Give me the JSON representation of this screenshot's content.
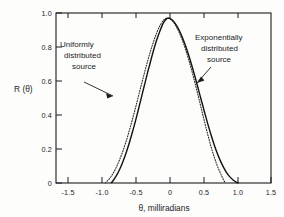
{
  "chart_data": {
    "type": "line",
    "title": "",
    "subtitle": "",
    "xlabel": "θ, milliradians",
    "ylabel": "R (θ)",
    "xlim": [
      -1.75,
      1.65
    ],
    "ylim": [
      0,
      1.0
    ],
    "grid": false,
    "legend_position": "inline-annotations",
    "xticks": [
      -1.5,
      -1.0,
      -0.5,
      0,
      0.5,
      1.0,
      1.5
    ],
    "xtick_labels": [
      "-1.5",
      "-1.0",
      "-0.5",
      "0",
      "0.5",
      "1.0",
      "1.5"
    ],
    "yticks": [
      0,
      0.2,
      0.4,
      0.6,
      0.8,
      1.0
    ],
    "ytick_labels": [
      "0",
      "0.2",
      "0.4",
      "0.6",
      "0.8",
      "1.0"
    ],
    "annotations": [
      {
        "name": "uniformly-distributed-source",
        "lines": [
          "Uniformly",
          "distributed",
          "source"
        ],
        "arrow_from": [
          -1.18,
          0.62
        ],
        "arrow_to": [
          -0.82,
          0.5
        ]
      },
      {
        "name": "exponentially-distributed-source",
        "lines": [
          "Exponentially",
          "distributed",
          "source"
        ],
        "arrow_from": [
          0.72,
          0.83
        ],
        "arrow_to": [
          0.45,
          0.61
        ]
      }
    ],
    "series": [
      {
        "name": "Uniformly distributed source",
        "style": "solid",
        "color": "#111111",
        "x": [
          -0.88,
          -0.85,
          -0.8,
          -0.75,
          -0.7,
          -0.65,
          -0.6,
          -0.55,
          -0.5,
          -0.45,
          -0.4,
          -0.35,
          -0.3,
          -0.25,
          -0.2,
          -0.15,
          -0.1,
          -0.05,
          0.0,
          0.03,
          0.05,
          0.1,
          0.15,
          0.2,
          0.25,
          0.3,
          0.35,
          0.4,
          0.45,
          0.5,
          0.55,
          0.6,
          0.65,
          0.7,
          0.75,
          0.8,
          0.85,
          0.9,
          0.95,
          1.0,
          1.05,
          1.1,
          1.14
        ],
        "y": [
          0.0,
          0.012,
          0.04,
          0.075,
          0.118,
          0.168,
          0.225,
          0.288,
          0.355,
          0.428,
          0.502,
          0.578,
          0.652,
          0.722,
          0.79,
          0.85,
          0.9,
          0.943,
          0.967,
          0.97,
          0.968,
          0.955,
          0.93,
          0.897,
          0.855,
          0.806,
          0.75,
          0.688,
          0.622,
          0.553,
          0.484,
          0.415,
          0.348,
          0.285,
          0.227,
          0.175,
          0.13,
          0.092,
          0.06,
          0.036,
          0.018,
          0.005,
          0.0
        ]
      },
      {
        "name": "Exponentially distributed source",
        "style": "dotted",
        "color": "#2b2b2b",
        "x": [
          -0.97,
          -0.95,
          -0.9,
          -0.85,
          -0.8,
          -0.75,
          -0.7,
          -0.65,
          -0.6,
          -0.55,
          -0.5,
          -0.45,
          -0.4,
          -0.35,
          -0.3,
          -0.25,
          -0.2,
          -0.15,
          -0.1,
          -0.05,
          0.0,
          0.04,
          0.08,
          0.12,
          0.16,
          0.2,
          0.25,
          0.3,
          0.35,
          0.4,
          0.45,
          0.5,
          0.55,
          0.6,
          0.65,
          0.7,
          0.75,
          0.8,
          0.85,
          0.9,
          0.93
        ],
        "y": [
          0.0,
          0.008,
          0.028,
          0.055,
          0.09,
          0.132,
          0.18,
          0.235,
          0.296,
          0.362,
          0.432,
          0.505,
          0.578,
          0.65,
          0.718,
          0.782,
          0.84,
          0.89,
          0.93,
          0.958,
          0.97,
          0.968,
          0.958,
          0.94,
          0.915,
          0.884,
          0.838,
          0.784,
          0.723,
          0.656,
          0.585,
          0.51,
          0.434,
          0.358,
          0.285,
          0.216,
          0.155,
          0.102,
          0.058,
          0.018,
          0.0
        ]
      }
    ]
  },
  "plot_geometry": {
    "left_px": 56,
    "right_px": 271,
    "top_px": 13,
    "bottom_px": 183
  }
}
